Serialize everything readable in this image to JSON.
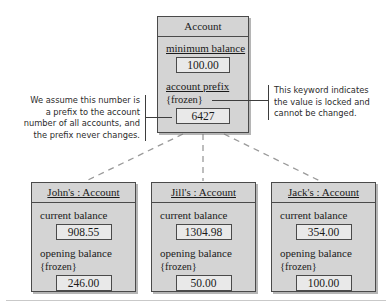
{
  "diagram": {
    "type": "uml-object-diagram",
    "colors": {
      "box_fill": "#d4d4d4",
      "slot_fill": "#e9e9e9",
      "line": "#4a4a4a",
      "dashed_link": "#9a9a9a",
      "note_text": "#2b2b2b"
    },
    "class_box": {
      "name": "class-account",
      "title": "Account",
      "title_underlined": false,
      "attributes": [
        {
          "name": "minimum balance",
          "keyword": "",
          "value": "100.00"
        },
        {
          "name": "account prefix",
          "keyword": "{frozen}",
          "value": "6427"
        }
      ]
    },
    "instances": [
      {
        "name": "object-johns-account",
        "title": "John's : Account",
        "title_underlined": true,
        "attributes": [
          {
            "name": "current balance",
            "keyword": "",
            "value": "908.55"
          },
          {
            "name": "opening balance",
            "keyword": "{frozen}",
            "value": "246.00"
          }
        ]
      },
      {
        "name": "object-jills-account",
        "title": "Jill's : Account",
        "title_underlined": true,
        "attributes": [
          {
            "name": "current balance",
            "keyword": "",
            "value": "1304.98"
          },
          {
            "name": "opening balance",
            "keyword": "{frozen}",
            "value": "50.00"
          }
        ]
      },
      {
        "name": "object-jacks-account",
        "title": "Jack's : Account",
        "title_underlined": true,
        "attributes": [
          {
            "name": "current balance",
            "keyword": "",
            "value": "354.00"
          },
          {
            "name": "opening balance",
            "keyword": "{frozen}",
            "value": "100.00"
          }
        ]
      }
    ],
    "notes": {
      "left": {
        "target": "account prefix value 6427",
        "lines": [
          "We assume this number is",
          "a prefix to the account",
          "number of all accounts, and",
          "the prefix never changes."
        ]
      },
      "right": {
        "target": "{frozen} keyword",
        "lines": [
          "This keyword indicates",
          "the value is locked and",
          "cannot be changed."
        ]
      }
    }
  }
}
